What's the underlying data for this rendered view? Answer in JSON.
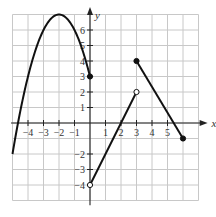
{
  "chart_data": {
    "type": "line",
    "title": "",
    "xlabel": "x",
    "ylabel": "y",
    "xlim": [
      -5,
      7
    ],
    "ylim": [
      -5,
      7
    ],
    "grid": true,
    "x_tick_labels": [
      "-4",
      "-3",
      "-2",
      "-1",
      "1",
      "2",
      "3",
      "4",
      "5"
    ],
    "y_tick_labels": [
      "6",
      "5",
      "4",
      "3",
      "2",
      "1",
      "-2",
      "-3",
      "-4"
    ],
    "series": [
      {
        "name": "parabola piece",
        "kind": "curve",
        "equation": "y = 7 - (x + 2)^2",
        "domain": [
          -5,
          0
        ],
        "points": [
          [
            -5,
            -2
          ],
          [
            -4,
            3
          ],
          [
            -3,
            6
          ],
          [
            -2,
            7
          ],
          [
            -1,
            6
          ],
          [
            0,
            3
          ]
        ],
        "endpoints": [
          {
            "x": 0,
            "y": 3,
            "style": "closed"
          }
        ]
      },
      {
        "name": "increasing line",
        "kind": "segment",
        "points": [
          [
            0,
            -4
          ],
          [
            3,
            2
          ]
        ],
        "endpoints": [
          {
            "x": 0,
            "y": -4,
            "style": "open"
          },
          {
            "x": 3,
            "y": 2,
            "style": "open"
          }
        ]
      },
      {
        "name": "decreasing line",
        "kind": "segment",
        "points": [
          [
            3,
            4
          ],
          [
            6,
            -1
          ]
        ],
        "endpoints": [
          {
            "x": 3,
            "y": 4,
            "style": "closed"
          },
          {
            "x": 6,
            "y": -1,
            "style": "closed"
          }
        ]
      }
    ]
  },
  "colors": {
    "grid": "#c8c8c8",
    "axis": "#222222",
    "curve": "#111111",
    "background": "#ffffff"
  }
}
